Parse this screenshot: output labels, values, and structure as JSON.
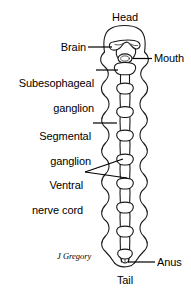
{
  "figure": {
    "background_color": "#ffffff",
    "ink_color": "#1a1a1a",
    "signature": "J Gregory"
  },
  "labels": {
    "head": "Head",
    "brain": "Brain",
    "mouth": "Mouth",
    "subesophageal_line1": "Subesophageal",
    "subesophageal_line2": "ganglion",
    "segmental_line1": "Segmental",
    "segmental_line2": "ganglion",
    "ventral_line1": "Ventral",
    "ventral_line2": "nerve cord",
    "anus": "Anus",
    "tail": "Tail"
  }
}
